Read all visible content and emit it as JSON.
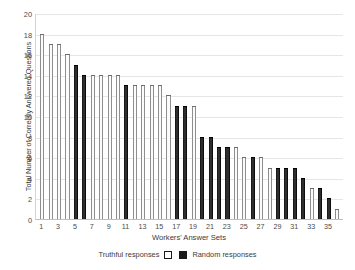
{
  "chart_data": {
    "type": "bar",
    "title": "",
    "xlabel": "Workers' Answer Sets",
    "ylabel": "Total Number of Correctly Answered Questions",
    "ylim": [
      0,
      20
    ],
    "ytick_step": 2,
    "yticks": [
      20,
      18,
      16,
      14,
      12,
      10,
      8,
      6,
      4,
      2,
      0
    ],
    "grid": true,
    "legend_position": "bottom-center",
    "categories": [
      1,
      2,
      3,
      4,
      5,
      6,
      7,
      8,
      9,
      10,
      11,
      12,
      13,
      14,
      15,
      16,
      17,
      18,
      19,
      20,
      21,
      22,
      23,
      24,
      25,
      26,
      27,
      28,
      29,
      30,
      31,
      32,
      33,
      34,
      35,
      36
    ],
    "xtick_labels": [
      "1",
      "",
      "3",
      "",
      "5",
      "",
      "7",
      "",
      "9",
      "",
      "11",
      "",
      "13",
      "",
      "15",
      "",
      "17",
      "",
      "19",
      "",
      "21",
      "",
      "23",
      "",
      "25",
      "",
      "27",
      "",
      "29",
      "",
      "31",
      "",
      "33",
      "",
      "35",
      ""
    ],
    "values": [
      18,
      17,
      17,
      16,
      15,
      14,
      14,
      14,
      14,
      14,
      13,
      13,
      13,
      13,
      13,
      12,
      11,
      11,
      11,
      8,
      8,
      7,
      7,
      7,
      6,
      6,
      6,
      5,
      5,
      5,
      5,
      4,
      3,
      3,
      2,
      1
    ],
    "bar_types": [
      "truthful",
      "truthful",
      "truthful",
      "truthful",
      "random",
      "random",
      "truthful",
      "truthful",
      "truthful",
      "truthful",
      "random",
      "truthful",
      "truthful",
      "truthful",
      "truthful",
      "truthful",
      "random",
      "random",
      "truthful",
      "random",
      "random",
      "random",
      "random",
      "truthful",
      "truthful",
      "random",
      "truthful",
      "truthful",
      "random",
      "random",
      "random",
      "random",
      "truthful",
      "random",
      "random",
      "truthful"
    ],
    "series": [
      {
        "name": "Truthful responses",
        "color": "#ffffff",
        "edge_color": "#1a1a1a"
      },
      {
        "name": "Random responses",
        "color": "#1a1a1a",
        "edge_color": "#1a1a1a"
      }
    ]
  },
  "legend": {
    "truthful_label": "Truthful responses",
    "random_label": "Random responses"
  }
}
